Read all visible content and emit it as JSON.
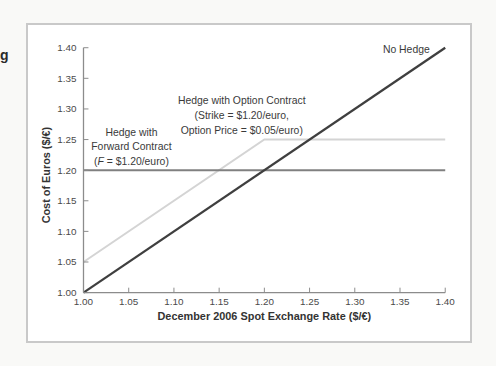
{
  "caption_fragment": "g",
  "chart_data": {
    "type": "line",
    "title": "",
    "xlabel": "December 2006 Spot Exchange Rate ($/€)",
    "ylabel": "Cost of Euros ($/€)",
    "xlim": [
      1.0,
      1.4
    ],
    "ylim": [
      1.0,
      1.4
    ],
    "x_ticks": [
      "1.00",
      "1.05",
      "1.10",
      "1.15",
      "1.20",
      "1.25",
      "1.30",
      "1.35",
      "1.40"
    ],
    "y_ticks": [
      "1.00",
      "1.05",
      "1.10",
      "1.15",
      "1.20",
      "1.25",
      "1.30",
      "1.35",
      "1.40"
    ],
    "grid": false,
    "legend_position": "inline-annotations",
    "axis_color": "#8c8c8c",
    "series": [
      {
        "name": "Hedge with Option Contract",
        "points": [
          [
            1.0,
            1.05
          ],
          [
            1.2,
            1.25
          ],
          [
            1.4,
            1.25
          ]
        ],
        "color": "#d4d4d4",
        "width": 2
      },
      {
        "name": "Hedge with Forward Contract",
        "points": [
          [
            1.0,
            1.2
          ],
          [
            1.4,
            1.2
          ]
        ],
        "color": "#808080",
        "width": 2
      },
      {
        "name": "No Hedge",
        "points": [
          [
            1.0,
            1.0
          ],
          [
            1.4,
            1.4
          ]
        ],
        "color": "#3f3f3f",
        "width": 2.3
      }
    ],
    "annotations": [
      {
        "name": "no-hedge-label",
        "x": 1.357,
        "y": 1.397,
        "align": "center",
        "lines": [
          "No Hedge"
        ]
      },
      {
        "name": "option-hedge-label",
        "x": 1.175,
        "y": 1.289,
        "align": "center",
        "lines": [
          "Hedge with Option Contract",
          "(Strike = $1.20/euro,",
          "Option Price = $0.05/euro)"
        ]
      },
      {
        "name": "forward-hedge-label",
        "x": 1.053,
        "y": 1.238,
        "align": "center",
        "lines": [
          "Hedge with",
          "Forward Contract",
          "(*F* = $1.20/euro)"
        ]
      }
    ]
  }
}
